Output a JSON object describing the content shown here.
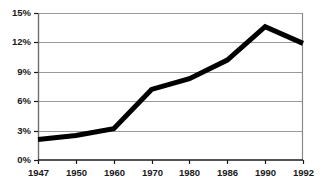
{
  "chart_data": {
    "type": "line",
    "title": "",
    "subtitle": "",
    "xlabel": "",
    "ylabel": "",
    "categories": [
      "1947",
      "1950",
      "1960",
      "1970",
      "1980",
      "1986",
      "1990",
      "1992"
    ],
    "values": [
      2.1,
      2.5,
      3.2,
      7.2,
      8.3,
      10.2,
      13.6,
      11.9
    ],
    "series": [
      {
        "name": "",
        "values": [
          2.1,
          2.5,
          3.2,
          7.2,
          8.3,
          10.2,
          13.6,
          11.9
        ]
      }
    ],
    "ylim": [
      0,
      15
    ],
    "yticks": [
      0,
      3,
      6,
      9,
      12,
      15
    ],
    "ytick_labels": [
      "0%",
      "3%",
      "6%",
      "9%",
      "12%",
      "15%"
    ],
    "xtick_labels": [
      "1947",
      "1950",
      "1960",
      "1970",
      "1980",
      "1986",
      "1990",
      "1992"
    ],
    "grid": "horizontal",
    "legend": "none",
    "line_color": "#000000",
    "grid_color": "#9a9a9a",
    "axis_color": "#6e6e6e",
    "background_color": "#ffffff",
    "line_width": 5
  },
  "layout": {
    "plot_left": 38,
    "plot_right": 303,
    "plot_top": 13,
    "plot_bottom": 160
  }
}
